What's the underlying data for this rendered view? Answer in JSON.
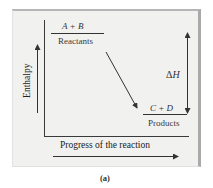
{
  "figure": {
    "caption": "(a)",
    "y_axis_label": "Enthalpy",
    "x_axis_label": "Progress of the reaction",
    "reactants": {
      "formula": "A + B",
      "label": "Reactants"
    },
    "products": {
      "formula": "C + D",
      "label": "Products"
    },
    "delta_h": {
      "symbol": "Δ",
      "variable": "H"
    },
    "colors": {
      "background": "#f1f1f0",
      "lines": "#333333",
      "border_shadow": "#a9a9a9"
    }
  }
}
